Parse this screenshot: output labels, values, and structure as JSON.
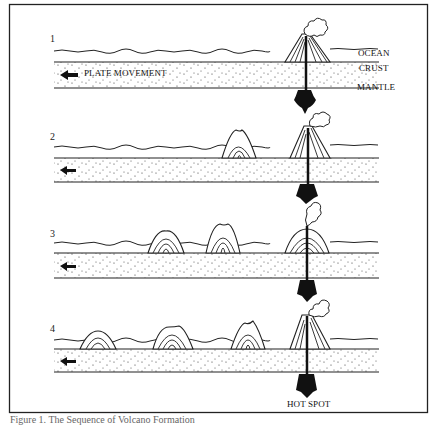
{
  "figure": {
    "caption": "Figure 1. The Sequence of Volcano Formation",
    "stage_numbers": [
      "1",
      "2",
      "3",
      "4"
    ],
    "labels": {
      "ocean": "OCEAN",
      "crust": "CRUST",
      "mantle": "MANTLE",
      "plate_movement": "PLATE MOVEMENT",
      "hot_spot": "HOT SPOT"
    },
    "stages": [
      {
        "index": 1,
        "volcanoes": 1
      },
      {
        "index": 2,
        "volcanoes": 2
      },
      {
        "index": 3,
        "volcanoes": 3
      },
      {
        "index": 4,
        "volcanoes": 4
      }
    ],
    "icons": [
      "plate-movement-arrow-icon",
      "smoke-plume-icon",
      "magma-hot-spot-icon"
    ]
  }
}
